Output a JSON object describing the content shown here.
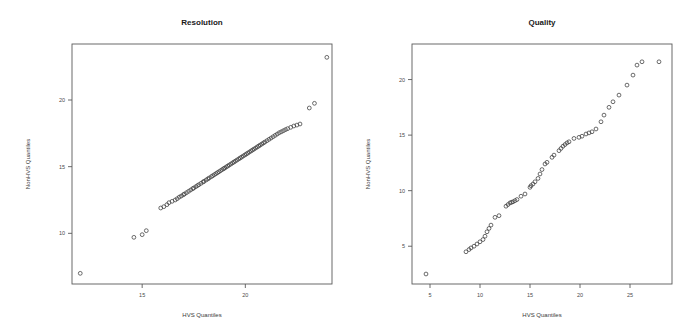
{
  "figure": {
    "background": "#ffffff",
    "marker_color": "#3c3c3c",
    "axis_color": "#5a5a5a",
    "panel_count": 2
  },
  "chart_data": [
    {
      "type": "scatter",
      "title": "Resolution",
      "xlabel": "HVS Quantiles",
      "ylabel": "NonHVS Quantiles",
      "xticks": [
        10,
        15,
        20
      ],
      "yticks": [
        10,
        15,
        20
      ],
      "xlim": [
        11.6,
        24.2
      ],
      "ylim": [
        6.2,
        24.2
      ],
      "grid": false,
      "legend": "none",
      "marker": "open-circle",
      "points": [
        [
          12.0,
          7.0
        ],
        [
          14.6,
          9.7
        ],
        [
          15.0,
          9.9
        ],
        [
          15.2,
          10.2
        ],
        [
          15.9,
          11.9
        ],
        [
          16.05,
          12.0
        ],
        [
          16.2,
          12.15
        ],
        [
          16.3,
          12.3
        ],
        [
          16.45,
          12.4
        ],
        [
          16.6,
          12.5
        ],
        [
          16.7,
          12.6
        ],
        [
          16.8,
          12.72
        ],
        [
          16.9,
          12.8
        ],
        [
          17.0,
          12.9
        ],
        [
          17.05,
          12.95
        ],
        [
          17.15,
          13.05
        ],
        [
          17.25,
          13.15
        ],
        [
          17.35,
          13.25
        ],
        [
          17.45,
          13.35
        ],
        [
          17.5,
          13.4
        ],
        [
          17.6,
          13.5
        ],
        [
          17.68,
          13.58
        ],
        [
          17.75,
          13.65
        ],
        [
          17.85,
          13.75
        ],
        [
          17.95,
          13.85
        ],
        [
          18.0,
          13.9
        ],
        [
          18.1,
          14.0
        ],
        [
          18.18,
          14.08
        ],
        [
          18.25,
          14.15
        ],
        [
          18.35,
          14.25
        ],
        [
          18.42,
          14.32
        ],
        [
          18.5,
          14.4
        ],
        [
          18.58,
          14.48
        ],
        [
          18.65,
          14.55
        ],
        [
          18.72,
          14.62
        ],
        [
          18.8,
          14.7
        ],
        [
          18.88,
          14.78
        ],
        [
          18.95,
          14.85
        ],
        [
          19.0,
          14.9
        ],
        [
          19.08,
          14.98
        ],
        [
          19.15,
          15.05
        ],
        [
          19.22,
          15.12
        ],
        [
          19.3,
          15.2
        ],
        [
          19.38,
          15.28
        ],
        [
          19.45,
          15.35
        ],
        [
          19.52,
          15.42
        ],
        [
          19.6,
          15.5
        ],
        [
          19.68,
          15.58
        ],
        [
          19.75,
          15.65
        ],
        [
          19.82,
          15.72
        ],
        [
          19.9,
          15.8
        ],
        [
          19.98,
          15.88
        ],
        [
          20.05,
          15.95
        ],
        [
          20.12,
          16.02
        ],
        [
          20.2,
          16.1
        ],
        [
          20.28,
          16.18
        ],
        [
          20.35,
          16.25
        ],
        [
          20.42,
          16.32
        ],
        [
          20.5,
          16.4
        ],
        [
          20.58,
          16.48
        ],
        [
          20.65,
          16.55
        ],
        [
          20.72,
          16.62
        ],
        [
          20.8,
          16.7
        ],
        [
          20.88,
          16.78
        ],
        [
          20.95,
          16.85
        ],
        [
          21.05,
          16.95
        ],
        [
          21.15,
          17.05
        ],
        [
          21.25,
          17.15
        ],
        [
          21.35,
          17.25
        ],
        [
          21.45,
          17.35
        ],
        [
          21.55,
          17.45
        ],
        [
          21.65,
          17.55
        ],
        [
          21.75,
          17.62
        ],
        [
          21.85,
          17.7
        ],
        [
          21.95,
          17.78
        ],
        [
          22.05,
          17.85
        ],
        [
          22.2,
          17.95
        ],
        [
          22.35,
          18.05
        ],
        [
          22.5,
          18.12
        ],
        [
          22.65,
          18.2
        ],
        [
          23.1,
          19.4
        ],
        [
          23.35,
          19.75
        ],
        [
          23.95,
          23.2
        ]
      ]
    },
    {
      "type": "scatter",
      "title": "Quality",
      "xlabel": "HVS Quantiles",
      "ylabel": "NonHVS Quantiles",
      "xticks": [
        5,
        10,
        15,
        20,
        25
      ],
      "yticks": [
        5,
        10,
        15,
        20
      ],
      "xlim": [
        3.2,
        29.2
      ],
      "ylim": [
        1.6,
        23.2
      ],
      "grid": false,
      "legend": "none",
      "marker": "open-circle",
      "points": [
        [
          4.6,
          2.5
        ],
        [
          8.6,
          4.5
        ],
        [
          8.9,
          4.7
        ],
        [
          9.1,
          4.85
        ],
        [
          9.4,
          5.0
        ],
        [
          9.7,
          5.2
        ],
        [
          10.0,
          5.4
        ],
        [
          10.3,
          5.6
        ],
        [
          10.5,
          5.9
        ],
        [
          10.7,
          6.3
        ],
        [
          10.9,
          6.6
        ],
        [
          11.1,
          6.9
        ],
        [
          11.5,
          7.6
        ],
        [
          11.9,
          7.75
        ],
        [
          12.6,
          8.6
        ],
        [
          12.8,
          8.75
        ],
        [
          13.0,
          8.9
        ],
        [
          13.15,
          8.95
        ],
        [
          13.3,
          9.0
        ],
        [
          13.5,
          9.1
        ],
        [
          13.7,
          9.2
        ],
        [
          14.1,
          9.5
        ],
        [
          14.5,
          9.7
        ],
        [
          15.0,
          10.3
        ],
        [
          15.1,
          10.45
        ],
        [
          15.3,
          10.6
        ],
        [
          15.5,
          10.8
        ],
        [
          15.8,
          11.1
        ],
        [
          16.0,
          11.5
        ],
        [
          16.2,
          11.9
        ],
        [
          16.5,
          12.4
        ],
        [
          16.7,
          12.55
        ],
        [
          17.2,
          13.0
        ],
        [
          17.4,
          13.2
        ],
        [
          17.9,
          13.6
        ],
        [
          18.1,
          13.8
        ],
        [
          18.3,
          14.0
        ],
        [
          18.5,
          14.15
        ],
        [
          18.7,
          14.3
        ],
        [
          18.9,
          14.4
        ],
        [
          19.4,
          14.7
        ],
        [
          19.9,
          14.8
        ],
        [
          20.2,
          14.9
        ],
        [
          20.6,
          15.1
        ],
        [
          20.9,
          15.2
        ],
        [
          21.2,
          15.3
        ],
        [
          21.6,
          15.55
        ],
        [
          22.1,
          16.2
        ],
        [
          22.4,
          16.8
        ],
        [
          22.9,
          17.5
        ],
        [
          23.3,
          18.0
        ],
        [
          23.9,
          18.6
        ],
        [
          24.7,
          19.5
        ],
        [
          25.3,
          20.4
        ],
        [
          25.7,
          21.3
        ],
        [
          26.2,
          21.6
        ],
        [
          27.9,
          21.6
        ]
      ]
    }
  ]
}
